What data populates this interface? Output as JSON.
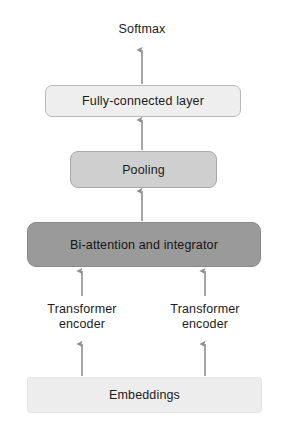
{
  "diagram": {
    "orientation": "bottom-to-top",
    "background_color": "#ffffff",
    "text_color": "#1c1c1c"
  },
  "nodes": {
    "softmax": {
      "label": "Softmax",
      "type": "text-only",
      "fill": "none"
    },
    "fully_connected": {
      "label": "Fully-connected layer",
      "type": "rounded-box",
      "fill": "#eeeeee",
      "border": "#b9b9b9"
    },
    "pooling": {
      "label": "Pooling",
      "type": "rounded-box",
      "fill": "#cfcfcf",
      "border": "#a9a9a9"
    },
    "bi_attention": {
      "label": "Bi-attention and integrator",
      "type": "rounded-box",
      "fill": "#9a9a9a",
      "border": "#8a8a8a"
    },
    "transformer_encoder_left": {
      "label": "Transformer\nencoder",
      "type": "text-only",
      "fill": "none"
    },
    "transformer_encoder_right": {
      "label": "Transformer\nencoder",
      "type": "text-only",
      "fill": "none"
    },
    "embeddings": {
      "label": "Embeddings",
      "type": "box",
      "fill": "#ededed",
      "border": "#e4e4e4"
    }
  },
  "edges": [
    {
      "name": "fc-to-softmax",
      "from": "fully_connected",
      "to": "softmax",
      "style": "arrow-up",
      "color": "#8f8f8f"
    },
    {
      "name": "pooling-to-fc",
      "from": "pooling",
      "to": "fully_connected",
      "style": "arrow-up",
      "color": "#8f8f8f"
    },
    {
      "name": "biattention-to-pooling",
      "from": "bi_attention",
      "to": "pooling",
      "style": "arrow-up",
      "color": "#8f8f8f"
    },
    {
      "name": "encoder-left-to-biattention",
      "from": "transformer_encoder_left",
      "to": "bi_attention",
      "style": "arrow-up",
      "color": "#8f8f8f"
    },
    {
      "name": "encoder-right-to-biattention",
      "from": "transformer_encoder_right",
      "to": "bi_attention",
      "style": "arrow-up",
      "color": "#8f8f8f"
    },
    {
      "name": "embeddings-to-encoder-left",
      "from": "embeddings",
      "to": "transformer_encoder_left",
      "style": "arrow-up",
      "color": "#8f8f8f"
    },
    {
      "name": "embeddings-to-encoder-right",
      "from": "embeddings",
      "to": "transformer_encoder_right",
      "style": "arrow-up",
      "color": "#8f8f8f"
    }
  ]
}
